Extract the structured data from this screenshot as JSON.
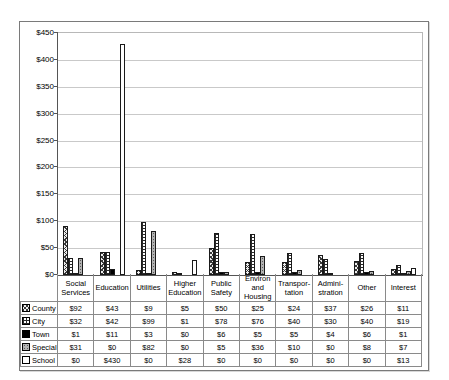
{
  "chart_data": {
    "type": "bar",
    "title": "",
    "categories": [
      "Social Services",
      "Education",
      "Utilities",
      "Higher Education",
      "Public Safety",
      "Environ and Housing",
      "Transportation",
      "Administration",
      "Other",
      "Interest"
    ],
    "category_display_lines": [
      [
        "Social",
        "Services"
      ],
      [
        "Education"
      ],
      [
        "Utilities"
      ],
      [
        "Higher",
        "Education"
      ],
      [
        "Public",
        "Safety"
      ],
      [
        "Environ",
        "and",
        "Housing"
      ],
      [
        "Transpor-",
        "tation"
      ],
      [
        "Admini-",
        "stration"
      ],
      [
        "Other"
      ],
      [
        "Interest"
      ]
    ],
    "series": [
      {
        "name": "County",
        "pattern": "county",
        "values": [
          92,
          43,
          9,
          5,
          50,
          25,
          24,
          37,
          26,
          11
        ]
      },
      {
        "name": "City",
        "pattern": "city",
        "values": [
          32,
          42,
          99,
          1,
          78,
          76,
          40,
          30,
          40,
          19
        ]
      },
      {
        "name": "Town",
        "pattern": "town",
        "values": [
          1,
          11,
          3,
          0,
          6,
          5,
          5,
          4,
          6,
          1
        ]
      },
      {
        "name": "Special",
        "pattern": "special",
        "values": [
          31,
          0,
          82,
          0,
          5,
          36,
          10,
          0,
          8,
          7
        ]
      },
      {
        "name": "School",
        "pattern": "school",
        "values": [
          0,
          430,
          0,
          28,
          0,
          0,
          0,
          0,
          0,
          13
        ]
      }
    ],
    "value_prefix": "$",
    "y_axis": {
      "min": 0,
      "max": 450,
      "step": 50,
      "tick_labels": [
        "$0",
        "$50",
        "$100",
        "$150",
        "$200",
        "$250",
        "$300",
        "$350",
        "$400",
        "$450"
      ]
    },
    "grid": true,
    "legend_position": "data-table-row-labels",
    "data_table_shown": true,
    "colors": {
      "grid_line": "#c9c9c9",
      "axis_line": "#555555",
      "frame_border": "#7a7a7a",
      "table_border": "#8a8a8a",
      "bar_outline": "#1a1a1a",
      "pattern_dark": "#2a2a2a",
      "special_gray": "#b2b2b2",
      "background": "#ffffff"
    }
  }
}
